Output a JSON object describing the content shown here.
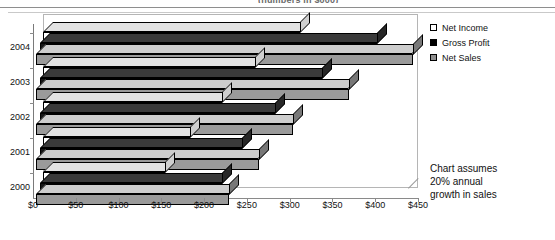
{
  "title_clipped": "(numbers in $000)",
  "legend": {
    "items": [
      {
        "label": "Net Income",
        "swatch": "white-square-icon",
        "color": "#ffffff"
      },
      {
        "label": "Gross Profit",
        "swatch": "black-square-icon",
        "color": "#000000"
      },
      {
        "label": "Net Sales",
        "swatch": "gray-square-icon",
        "color": "#8f8f8f"
      }
    ]
  },
  "note": {
    "line1": "Chart assumes",
    "line2": "20% annual",
    "line3": "growth in sales"
  },
  "axis": {
    "x_ticks": [
      "$0",
      "$50",
      "$100",
      "$150",
      "$200",
      "$250",
      "$300",
      "$350",
      "$400",
      "$450"
    ],
    "y_ticks": [
      "2004",
      "2003",
      "2002",
      "2001",
      "2000"
    ]
  },
  "chart_data": {
    "type": "bar",
    "orientation": "horizontal",
    "style": "3d-clustered",
    "title": "(numbers in $000)",
    "xlabel": "",
    "ylabel": "",
    "categories": [
      "2000",
      "2001",
      "2002",
      "2001",
      "2004"
    ],
    "category_order_top_to_bottom": [
      "2004",
      "2003",
      "2002",
      "2001",
      "2000"
    ],
    "xlim": [
      0,
      450
    ],
    "xtick_values": [
      0,
      50,
      100,
      150,
      200,
      250,
      300,
      350,
      400,
      450
    ],
    "xtick_labels": [
      "$0",
      "$50",
      "$100",
      "$150",
      "$200",
      "$250",
      "$300",
      "$350",
      "$400",
      "$450"
    ],
    "grid": false,
    "legend_position": "right-top",
    "units": "thousands of dollars",
    "annotation": "Chart assumes 20% annual growth in sales",
    "series": [
      {
        "name": "Net Income",
        "color": "#ffffff",
        "values_by_year": {
          "2000": 143,
          "2001": 172,
          "2002": 209,
          "2003": 248,
          "2004": 300
        }
      },
      {
        "name": "Gross Profit",
        "color": "#000000",
        "values_by_year": {
          "2000": 213,
          "2001": 236,
          "2002": 275,
          "2003": 330,
          "2004": 394
        }
      },
      {
        "name": "Net Sales",
        "color": "#8f8f8f",
        "values_by_year": {
          "2000": 225,
          "2001": 260,
          "2002": 300,
          "2003": 365,
          "2004": 440
        }
      }
    ],
    "rows": [
      {
        "year": "2004",
        "net_income": 300,
        "gross_profit": 394,
        "net_sales": 440
      },
      {
        "year": "2003",
        "net_income": 248,
        "gross_profit": 330,
        "net_sales": 365
      },
      {
        "year": "2002",
        "net_income": 209,
        "gross_profit": 275,
        "net_sales": 300
      },
      {
        "year": "2001",
        "net_income": 172,
        "gross_profit": 236,
        "net_sales": 260
      },
      {
        "year": "2000",
        "net_income": 143,
        "gross_profit": 213,
        "net_sales": 225
      }
    ]
  }
}
